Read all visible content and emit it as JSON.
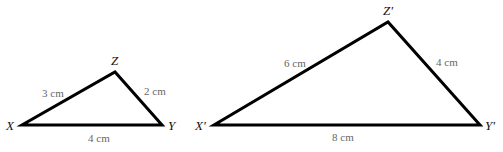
{
  "diagram": {
    "type": "similar-triangles",
    "triangles": [
      {
        "name": "XYZ",
        "vertices": {
          "X": {
            "label": "X",
            "x": 22,
            "y": 125
          },
          "Y": {
            "label": "Y",
            "x": 162,
            "y": 125
          },
          "Z": {
            "label": "Z",
            "x": 115,
            "y": 72
          }
        },
        "sides": {
          "XZ": "3 cm",
          "ZY": "2 cm",
          "XY": "4 cm"
        }
      },
      {
        "name": "X'Y'Z'",
        "vertices": {
          "X": {
            "label": "X′",
            "x": 214,
            "y": 125
          },
          "Y": {
            "label": "Y′",
            "x": 480,
            "y": 125
          },
          "Z": {
            "label": "Z′",
            "x": 388,
            "y": 22
          }
        },
        "sides": {
          "XZ": "6 cm",
          "ZY": "4 cm",
          "XY": "8 cm"
        }
      }
    ]
  }
}
